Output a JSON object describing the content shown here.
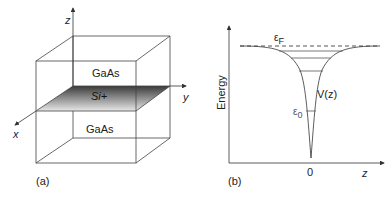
{
  "panel_a": {
    "label": "(a)",
    "axes": {
      "x": "x",
      "y": "y",
      "z": "z"
    },
    "top_layer": "GaAs",
    "dopant_plane": "Si+",
    "bottom_layer": "GaAs"
  },
  "panel_b": {
    "label": "(b)",
    "y_axis_label": "Energy",
    "x_axis_label": "z",
    "origin_tick": "0",
    "fermi_label": "εF",
    "fermi_main": "ε",
    "fermi_sub": "F",
    "potential_label": "V(z)",
    "ground_main": "ε",
    "ground_sub": "0"
  }
}
